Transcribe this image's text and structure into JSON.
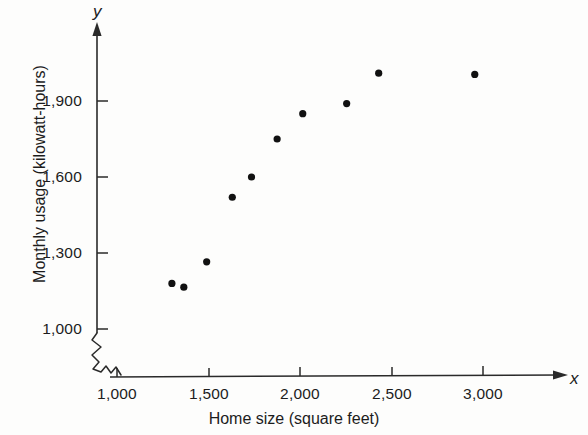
{
  "figure": {
    "background_color": "#fdfdfc",
    "ink_color": "#1c1c1c",
    "point_color": "#111111"
  },
  "axis_letters": {
    "y": "y",
    "x": "x"
  },
  "chart_data": {
    "type": "scatter",
    "title": "",
    "subtitle": "",
    "xlabel": "Home size (square feet)",
    "ylabel": "Monthly usage (kilowatt-hours)",
    "xlim": [
      1000,
      3200
    ],
    "ylim": [
      1000,
      2100
    ],
    "xticks": [
      1000,
      1500,
      2000,
      2500,
      3000
    ],
    "xticklabels": [
      "1,000",
      "1,500",
      "2,000",
      "2,500",
      "3,000"
    ],
    "yticks": [
      1000,
      1300,
      1600,
      1900
    ],
    "yticklabels": [
      "1,000",
      "1,300",
      "1,600",
      "1,900"
    ],
    "grid": false,
    "legend": null,
    "axis_break_x": true,
    "axis_break_y": true,
    "annotations": [],
    "series": [
      {
        "name": "Homes",
        "marker": "filled-circle",
        "color": "#111111",
        "points": [
          {
            "x": 1300,
            "y": 1180
          },
          {
            "x": 1365,
            "y": 1165
          },
          {
            "x": 1490,
            "y": 1265
          },
          {
            "x": 1630,
            "y": 1520
          },
          {
            "x": 1735,
            "y": 1600
          },
          {
            "x": 1875,
            "y": 1750
          },
          {
            "x": 2015,
            "y": 1850
          },
          {
            "x": 2255,
            "y": 1890
          },
          {
            "x": 2430,
            "y": 2010
          },
          {
            "x": 2955,
            "y": 2005
          }
        ]
      }
    ]
  }
}
